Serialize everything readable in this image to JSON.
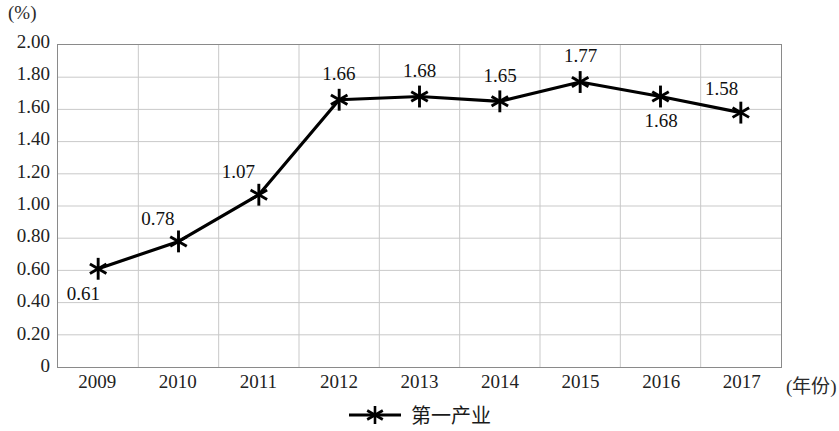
{
  "chart_data": {
    "type": "line",
    "title": "",
    "xlabel": "(年份)",
    "ylabel": "(%)",
    "categories": [
      "2009",
      "2010",
      "2011",
      "2012",
      "2013",
      "2014",
      "2015",
      "2016",
      "2017"
    ],
    "series": [
      {
        "name": "第一产业",
        "values": [
          0.61,
          0.78,
          1.07,
          1.66,
          1.68,
          1.65,
          1.77,
          1.68,
          1.58
        ],
        "marker": "asterisk-6-spoke",
        "color": "#000000"
      }
    ],
    "point_labels": [
      "0.61",
      "0.78",
      "1.07",
      "1.66",
      "1.68",
      "1.65",
      "1.77",
      "1.68",
      "1.58"
    ],
    "point_label_positions": [
      "below-left",
      "above-left",
      "above-left",
      "above",
      "above",
      "above",
      "above",
      "below",
      "above-left"
    ],
    "ylim": [
      0,
      2.0
    ],
    "ytick_step": 0.2,
    "ytick_labels": [
      "2.00",
      "1.80",
      "1.60",
      "1.40",
      "1.20",
      "1.00",
      "0.80",
      "0.60",
      "0.40",
      "0.20",
      "0"
    ],
    "ytick_values": [
      2.0,
      1.8,
      1.6,
      1.4,
      1.2,
      1.0,
      0.8,
      0.6,
      0.4,
      0.2,
      0
    ],
    "grid": {
      "horizontal": true,
      "vertical": true,
      "color": "#c9c9c9"
    },
    "legend": {
      "position": "bottom-center",
      "entries": [
        "第一产业"
      ]
    },
    "frame_color": "#8a8a8a",
    "background": "#ffffff"
  }
}
